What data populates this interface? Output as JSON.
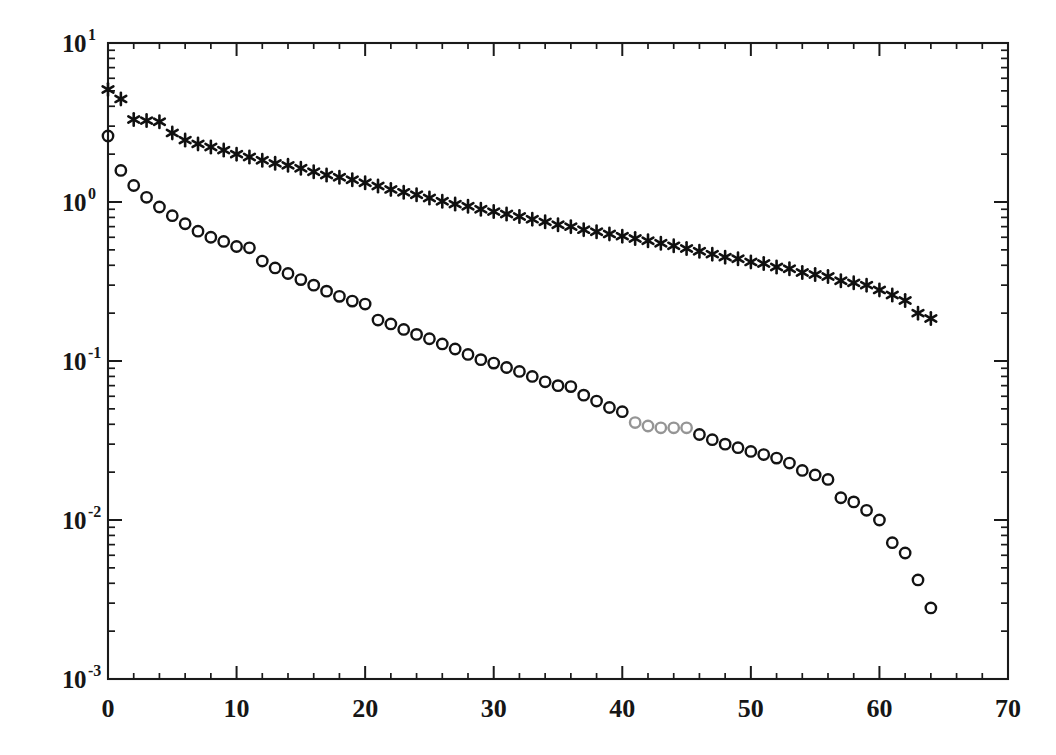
{
  "figure": {
    "title": "",
    "background_color": "#ffffff",
    "ink_color": "#161616"
  },
  "axes": {
    "x": {
      "label": "",
      "scale": "linear",
      "limits": [
        0,
        70
      ],
      "major_ticks": [
        0,
        10,
        20,
        30,
        40,
        50,
        60,
        70
      ],
      "tick_labels": [
        "0",
        "10",
        "20",
        "30",
        "40",
        "50",
        "60",
        "70"
      ],
      "minor_tick_step": 2
    },
    "y": {
      "label": "",
      "scale": "log10",
      "limits": [
        0.001,
        10
      ],
      "major_ticks": [
        10,
        1,
        0.1,
        0.01,
        0.001
      ],
      "tick_labels": [
        "10",
        "10",
        "10",
        "10",
        "10"
      ],
      "tick_exponents": [
        "1",
        "0",
        "-1",
        "-2",
        "-3"
      ],
      "minor_ticks_per_decade": [
        2,
        3,
        4,
        5,
        6,
        7,
        8,
        9
      ]
    },
    "grid": "off",
    "frame": "box-all-sides",
    "tick_direction": "in"
  },
  "legend": {
    "present": false,
    "entries": []
  },
  "annotations": [
    {
      "name": "scan-artifact",
      "description": "faded / partially printed circle markers",
      "x_range": [
        41,
        45
      ]
    }
  ],
  "chart_data": {
    "type": "scatter",
    "title": "",
    "xlabel": "",
    "ylabel": "",
    "xlim": [
      0,
      70
    ],
    "ylim": [
      0.001,
      10
    ],
    "yscale": "log",
    "xscale": "linear",
    "grid": false,
    "legend_position": "none",
    "series": [
      {
        "name": "series-asterisk",
        "marker": "asterisk",
        "color": "#101010",
        "x": [
          0,
          1,
          2,
          3,
          4,
          5,
          6,
          7,
          8,
          9,
          10,
          11,
          12,
          13,
          14,
          15,
          16,
          17,
          18,
          19,
          20,
          21,
          22,
          23,
          24,
          25,
          26,
          27,
          28,
          29,
          30,
          31,
          32,
          33,
          34,
          35,
          36,
          37,
          38,
          39,
          40,
          41,
          42,
          43,
          44,
          45,
          46,
          47,
          48,
          49,
          50,
          51,
          52,
          53,
          54,
          55,
          56,
          57,
          58,
          59,
          60,
          61,
          62,
          63,
          64
        ],
        "y": [
          5.1,
          4.45,
          3.3,
          3.25,
          3.2,
          2.72,
          2.45,
          2.32,
          2.22,
          2.12,
          2.0,
          1.92,
          1.83,
          1.75,
          1.7,
          1.63,
          1.55,
          1.48,
          1.43,
          1.38,
          1.32,
          1.26,
          1.2,
          1.15,
          1.11,
          1.06,
          1.01,
          0.97,
          0.94,
          0.9,
          0.87,
          0.84,
          0.81,
          0.78,
          0.75,
          0.72,
          0.7,
          0.67,
          0.65,
          0.63,
          0.61,
          0.59,
          0.57,
          0.55,
          0.53,
          0.51,
          0.49,
          0.47,
          0.45,
          0.44,
          0.42,
          0.41,
          0.39,
          0.38,
          0.36,
          0.35,
          0.34,
          0.32,
          0.31,
          0.3,
          0.28,
          0.26,
          0.24,
          0.2,
          0.185
        ]
      },
      {
        "name": "series-circle",
        "marker": "open-circle",
        "color": "#131313",
        "x": [
          0,
          1,
          2,
          3,
          4,
          5,
          6,
          7,
          8,
          9,
          10,
          11,
          12,
          13,
          14,
          15,
          16,
          17,
          18,
          19,
          20,
          21,
          22,
          23,
          24,
          25,
          26,
          27,
          28,
          29,
          30,
          31,
          32,
          33,
          34,
          35,
          36,
          37,
          38,
          39,
          40,
          41,
          42,
          43,
          44,
          45,
          46,
          47,
          48,
          49,
          50,
          51,
          52,
          53,
          54,
          55,
          56,
          57,
          58,
          59,
          60,
          61,
          62,
          63,
          64
        ],
        "y": [
          2.6,
          1.58,
          1.27,
          1.07,
          0.93,
          0.82,
          0.73,
          0.655,
          0.6,
          0.565,
          0.525,
          0.515,
          0.425,
          0.385,
          0.355,
          0.325,
          0.3,
          0.275,
          0.255,
          0.238,
          0.228,
          0.181,
          0.171,
          0.158,
          0.147,
          0.138,
          0.128,
          0.119,
          0.11,
          0.102,
          0.097,
          0.091,
          0.086,
          0.08,
          0.074,
          0.07,
          0.069,
          0.061,
          0.056,
          0.051,
          0.048,
          0.041,
          0.039,
          0.038,
          0.038,
          0.038,
          0.0345,
          0.032,
          0.03,
          0.0285,
          0.027,
          0.0258,
          0.0245,
          0.0228,
          0.0205,
          0.0192,
          0.018,
          0.0138,
          0.013,
          0.0115,
          0.01,
          0.0072,
          0.0062,
          0.0042,
          0.0028
        ],
        "faded_indices": [
          41,
          42,
          43,
          44,
          45
        ]
      }
    ]
  },
  "geometry": {
    "plot_left_px": 108,
    "plot_right_px": 1008,
    "plot_top_px": 43,
    "plot_bottom_px": 679
  }
}
